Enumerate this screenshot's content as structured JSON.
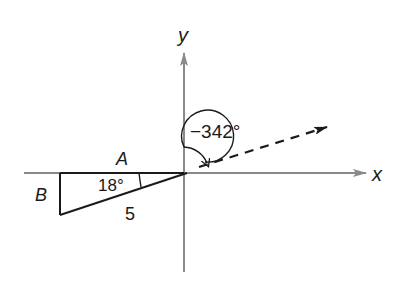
{
  "diagram": {
    "axes": {
      "x_label": "x",
      "y_label": "y",
      "axis_color": "#8a8a8a"
    },
    "triangle": {
      "angle_label": "18°",
      "adjacent_label": "A",
      "opposite_label": "B",
      "hypotenuse_label": "5",
      "stroke_color": "#1a1a1a"
    },
    "rotation": {
      "angle_label": "−342°",
      "terminal_side": "dashed ray at 18° above positive x-axis"
    }
  }
}
